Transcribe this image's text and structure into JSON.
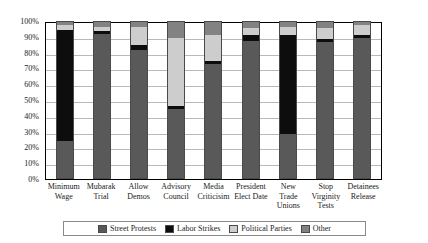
{
  "chart_data": {
    "type": "bar",
    "stacked": true,
    "title": "",
    "xlabel": "",
    "ylabel": "",
    "ylim": [
      0,
      100
    ],
    "ytick_labels": [
      "100%",
      "90%",
      "80%",
      "70%",
      "60%",
      "50%",
      "40%",
      "30%",
      "20%",
      "10%",
      "0%"
    ],
    "ytick_values": [
      100,
      90,
      80,
      70,
      60,
      50,
      40,
      30,
      20,
      10,
      0
    ],
    "grid": true,
    "legend_position": "bottom",
    "categories": [
      "Minimum\nWage",
      "Mubarak\nTrial",
      "Allow\nDemos",
      "Advisory\nCouncil",
      "Media\nCriticisim",
      "President\nElect Date",
      "New\nTrade\nUnions",
      "Stop\nVirginity\nTests",
      "Detainees\nRelease"
    ],
    "series": [
      {
        "name": "Street Protests",
        "color": "#595959",
        "values": [
          24,
          92,
          82,
          44,
          73,
          88,
          28,
          87,
          90
        ]
      },
      {
        "name": "Labor Strikes",
        "color": "#0d0d0d",
        "values": [
          71,
          2,
          3,
          2,
          2,
          4,
          64,
          2,
          2
        ]
      },
      {
        "name": "Political Parties",
        "color": "#cdcdcd",
        "values": [
          3,
          3,
          12,
          44,
          17,
          4,
          5,
          7,
          6
        ]
      },
      {
        "name": "Other",
        "color": "#828282",
        "values": [
          2,
          3,
          3,
          10,
          8,
          4,
          3,
          4,
          2
        ]
      }
    ]
  }
}
